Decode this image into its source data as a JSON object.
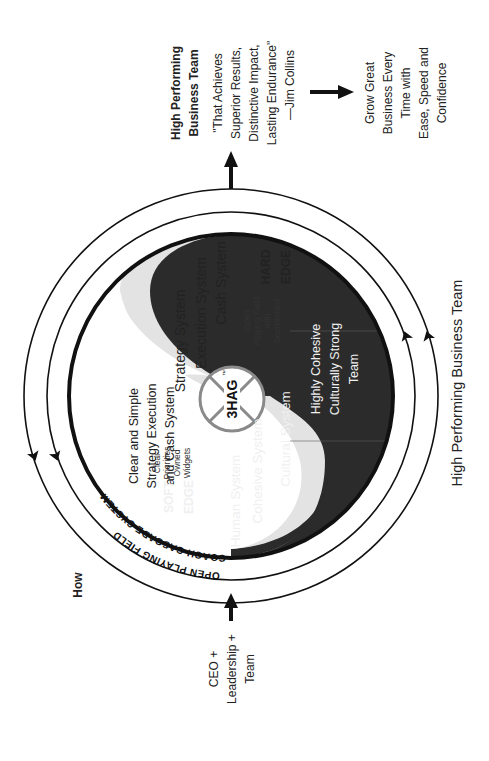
{
  "diagram": {
    "title": "High Performing Business Team",
    "how_label": "How",
    "input": {
      "lines": [
        "CEO +",
        "Leadership +",
        "Team"
      ]
    },
    "output": {
      "heading": [
        "High Performing",
        "Business Team"
      ],
      "quote": [
        "\"That Achieves",
        "Superior Results,",
        "Distinctive Impact,",
        "Lasting Endurance\"",
        "—Jim Collins"
      ]
    },
    "result": {
      "lines": [
        "Grow Great",
        "Business Every",
        "Time with",
        "Ease, Speed and",
        "Confidence"
      ]
    },
    "rings": {
      "outer": "OPEN PLAYING FIELD",
      "middle": "COACH CASCADE SYSTEM"
    },
    "center": {
      "label": "3HAG",
      "trademark": "™"
    },
    "hard_side": {
      "edge": [
        "HARD",
        "EDGE"
      ],
      "summary": [
        "Clear and Simple",
        "Strategy Execution",
        "and Cash System"
      ],
      "systems": [
        "Strategy System",
        "Execution System",
        "Cash System"
      ],
      "gray_note": [
        "Open",
        "Playing Field",
        "with",
        "Scoreboard"
      ]
    },
    "soft_side": {
      "edge": [
        "SOFT",
        "EDGE"
      ],
      "summary": [
        "Highly Cohesive",
        "Culturally Strong",
        "Team"
      ],
      "systems": [
        "Human System",
        "Cohesive System",
        "Cultural System"
      ],
      "gray_note": [
        "Clear",
        "Priorities",
        "Owned",
        "Widgets"
      ]
    },
    "colors": {
      "dark": "#2b2b2b",
      "gray": "#e3e3e3",
      "ring": "#111111",
      "center_ring": "#8a8a8a",
      "light_text": "#f0f0f0"
    }
  }
}
